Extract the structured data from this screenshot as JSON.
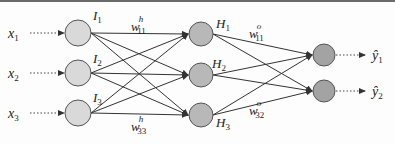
{
  "diagram": {
    "type": "feedforward-neural-network",
    "colors": {
      "input_node": "#d9d9d9",
      "hidden_node": "#b8b8b8",
      "output_node": "#a3a3a3",
      "node_stroke": "#555555",
      "edge": "#333333",
      "top_rule": "#6a6a6a"
    },
    "inputs": [
      {
        "label": "x",
        "sub": "1",
        "y": 33
      },
      {
        "label": "x",
        "sub": "2",
        "y": 73
      },
      {
        "label": "x",
        "sub": "3",
        "y": 113
      }
    ],
    "input_nodes": [
      {
        "label": "I",
        "sub": "1",
        "cx": 78,
        "cy": 33
      },
      {
        "label": "I",
        "sub": "2",
        "cx": 78,
        "cy": 73
      },
      {
        "label": "I",
        "sub": "3",
        "cx": 78,
        "cy": 113
      }
    ],
    "hidden_nodes": [
      {
        "label": "H",
        "sub": "1",
        "cx": 201,
        "cy": 34
      },
      {
        "label": "H",
        "sub": "2",
        "cx": 201,
        "cy": 75
      },
      {
        "label": "H",
        "sub": "3",
        "cx": 201,
        "cy": 115
      }
    ],
    "output_nodes": [
      {
        "cx": 324,
        "cy": 55
      },
      {
        "cx": 324,
        "cy": 91
      }
    ],
    "outputs": [
      {
        "label": "ŷ",
        "sub": "1"
      },
      {
        "label": "ŷ",
        "sub": "2"
      }
    ],
    "weight_labels": [
      {
        "label": "w",
        "sup": "h",
        "sub": "11"
      },
      {
        "label": "w",
        "sup": "h",
        "sub": "33"
      },
      {
        "label": "w",
        "sup": "o",
        "sub": "11"
      },
      {
        "label": "w",
        "sup": "o",
        "sub": "32"
      }
    ]
  }
}
